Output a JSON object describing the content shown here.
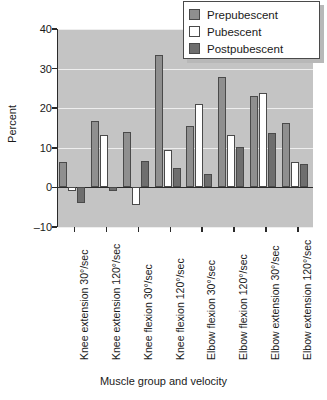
{
  "chart_data": {
    "type": "bar",
    "title": "",
    "xlabel": "Muscle group and velocity",
    "ylabel": "Percent",
    "ylim": [
      -10,
      40
    ],
    "yticks": [
      40,
      30,
      20,
      10,
      0,
      -10
    ],
    "ytick_labels": [
      "40",
      "30",
      "20",
      "10",
      "0",
      "–10"
    ],
    "grid": true,
    "legend_position": "top-right",
    "categories": [
      "Knee extension 30°/sec",
      "Knee extension 120°/sec",
      "Knee flexion 30°/sec",
      "Knee flexion 120°/sec",
      "Elbow flexion 30°/sec",
      "Elbow flexion 120°/sec",
      "Elbow extension 30°/sec",
      "Elbow extension 120°/sec"
    ],
    "series": [
      {
        "name": "Prepubescent",
        "color": "#8f8f8f",
        "values": [
          6.3,
          16.8,
          14.0,
          33.5,
          15.4,
          28.0,
          23.0,
          16.3
        ]
      },
      {
        "name": "Pubescent",
        "color": "#ffffff",
        "values": [
          -1.0,
          13.2,
          -4.5,
          9.5,
          21.1,
          13.3,
          23.9,
          6.5
        ]
      },
      {
        "name": "Postpubescent",
        "color": "#6e6e6e",
        "values": [
          -4.0,
          -1.0,
          6.6,
          5.0,
          3.5,
          10.2,
          13.7,
          6.0
        ]
      }
    ],
    "plot_background": "#c4c4c4",
    "axis_color": "#2a2a2a",
    "gridline_color": "#eeeeee"
  },
  "legend": {
    "items": [
      {
        "label": "Prepubescent",
        "swatch": "pre"
      },
      {
        "label": "Pubescent",
        "swatch": "pub"
      },
      {
        "label": "Postpubescent",
        "swatch": "post"
      }
    ]
  }
}
